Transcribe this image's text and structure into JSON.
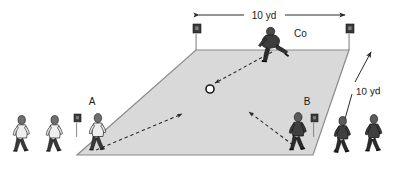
{
  "diagram": {
    "field": {
      "shape": "parallelogram",
      "fill_color": "#d9d9d9",
      "stroke_color": "#808080",
      "corners": {
        "top_left": [
          196,
          50
        ],
        "top_right": [
          349,
          50
        ],
        "bottom_right": [
          313,
          155
        ],
        "bottom_left": [
          77,
          155
        ]
      }
    },
    "dimension_top": {
      "label": "10 yd",
      "arrow_style": "double-headed-horizontal"
    },
    "dimension_right": {
      "label": "10 yd",
      "arrow_style": "double-headed-diagonal"
    },
    "markers": [
      {
        "name": "player-a",
        "label": "A",
        "shirt": "light",
        "role": "attacker-left"
      },
      {
        "name": "player-b",
        "label": "B",
        "shirt": "dark",
        "role": "attacker-right"
      },
      {
        "name": "coach",
        "label": "Co",
        "shirt": "dark",
        "role": "coach-server"
      },
      {
        "name": "ball",
        "label": "O",
        "shirt": "none",
        "role": "ball"
      }
    ],
    "ball": {
      "label": "O",
      "fill_color": "#ffffff",
      "stroke_color": "#1a1a1a"
    },
    "flags": [
      {
        "name": "flag-top-left"
      },
      {
        "name": "flag-top-right"
      },
      {
        "name": "flag-bottom-left"
      },
      {
        "name": "flag-bottom-right"
      }
    ],
    "movement_arrows": [
      {
        "name": "arrow-coach-to-ball",
        "style": "dashed",
        "from": "coach",
        "to": "ball"
      },
      {
        "name": "arrow-player-a-run",
        "style": "dashed",
        "from": "player-a",
        "to": "grid-center-left"
      },
      {
        "name": "arrow-player-b-run",
        "style": "dashed",
        "from": "player-b",
        "to": "grid-center-right"
      }
    ],
    "queues": {
      "left": {
        "count": 2,
        "shirt": "light"
      },
      "right": {
        "count": 2,
        "shirt": "dark"
      }
    },
    "colors": {
      "field_fill": "#d9d9d9",
      "field_stroke": "#808080",
      "dark_player": "#4d4d4d",
      "light_player": "#e8e8e8",
      "outline": "#1a1a1a",
      "arrow": "#333333"
    }
  }
}
